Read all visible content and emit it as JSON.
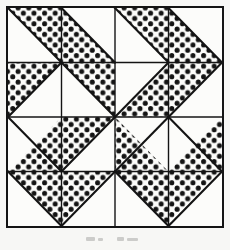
{
  "figure": {
    "kind": "quilt-block-diagram",
    "grid_rows": 4,
    "grid_cols": 4,
    "cell_size_px": 53.5,
    "colors": {
      "ink": "#141414",
      "paper": "#fbfbf9",
      "page_background": "#f7f7f5",
      "dot": "#141414",
      "unfilled": "#fcfcfa"
    },
    "border": {
      "outer_stroke_px": 2,
      "grid_stroke_px": 1.4,
      "diagonal_stroke_px": 2.1
    },
    "dots": {
      "radius_px": 2.5,
      "spacing_px": 10.6,
      "pattern": "staggered-grid"
    },
    "cells": [
      {
        "row": 0,
        "col": 0,
        "shaded_half": "upper-right",
        "diagonal": "main"
      },
      {
        "row": 0,
        "col": 1,
        "shaded_half": "lower-left",
        "diagonal": "main"
      },
      {
        "row": 0,
        "col": 2,
        "shaded_half": "upper-right",
        "diagonal": "main"
      },
      {
        "row": 0,
        "col": 3,
        "shaded_half": "lower-left",
        "diagonal": "main"
      },
      {
        "row": 1,
        "col": 0,
        "shaded_half": "upper-left",
        "diagonal": "anti"
      },
      {
        "row": 1,
        "col": 1,
        "shaded_half": "upper-right",
        "diagonal": "main"
      },
      {
        "row": 1,
        "col": 2,
        "shaded_half": "lower-right",
        "diagonal": "anti"
      },
      {
        "row": 1,
        "col": 3,
        "shaded_half": "upper-left",
        "diagonal": "anti"
      },
      {
        "row": 2,
        "col": 0,
        "shaded_half": "lower-right",
        "diagonal": "main"
      },
      {
        "row": 2,
        "col": 1,
        "shaded_half": "upper-left",
        "diagonal": "anti"
      },
      {
        "row": 2,
        "col": 2,
        "shaded_half": "lower-left",
        "diagonal": "anti"
      },
      {
        "row": 2,
        "col": 3,
        "shaded_half": "lower-right",
        "diagonal": "main"
      },
      {
        "row": 3,
        "col": 0,
        "shaded_half": "upper-right",
        "diagonal": "main"
      },
      {
        "row": 3,
        "col": 1,
        "shaded_half": "upper-left",
        "diagonal": "anti"
      },
      {
        "row": 3,
        "col": 2,
        "shaded_half": "upper-right",
        "diagonal": "main"
      },
      {
        "row": 3,
        "col": 3,
        "shaded_half": "upper-left",
        "diagonal": "anti"
      }
    ]
  }
}
